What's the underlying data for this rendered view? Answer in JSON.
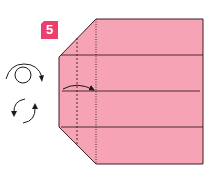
{
  "step": {
    "number": "5"
  },
  "colors": {
    "paper": "#f5a3b5",
    "badge": "#ec3f6c",
    "line": "#3a1e26"
  },
  "symbols": [
    {
      "name": "turn-over-symbol",
      "description": "Turn over"
    },
    {
      "name": "rotate-symbol",
      "description": "Rotate"
    }
  ],
  "folds": [
    {
      "type": "valley-fold-arrow",
      "description": "Fold left edge to the dotted line"
    }
  ]
}
